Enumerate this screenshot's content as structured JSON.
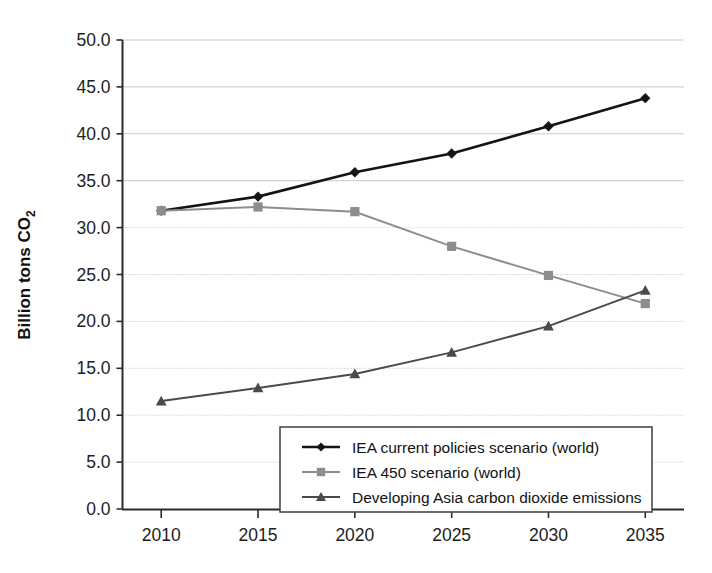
{
  "chart_data": {
    "type": "line",
    "title": "",
    "xlabel": "",
    "ylabel": "Billion tons CO2",
    "ylabel_main": "Billion tons CO",
    "ylabel_sub": "2",
    "x": [
      2010,
      2015,
      2020,
      2025,
      2030,
      2035
    ],
    "categories": [
      "2010",
      "2015",
      "2020",
      "2025",
      "2030",
      "2035"
    ],
    "xlim": [
      2008,
      2037
    ],
    "ylim": [
      0.0,
      50.0
    ],
    "ytick_labels": [
      "0.0",
      "5.0",
      "10.0",
      "15.0",
      "20.0",
      "25.0",
      "30.0",
      "35.0",
      "40.0",
      "45.0",
      "50.0"
    ],
    "ytick_values": [
      0,
      5,
      10,
      15,
      20,
      25,
      30,
      35,
      40,
      45,
      50
    ],
    "grid": true,
    "grid_style_note": "solid light gray above 35, dotted below 30",
    "legend_position": "lower center inside plot",
    "series": [
      {
        "name": "IEA current policies scenario (world)",
        "marker": "diamond",
        "color": "#141414",
        "values": [
          31.8,
          33.3,
          35.9,
          37.9,
          40.8,
          43.8
        ]
      },
      {
        "name": "IEA 450 scenario (world)",
        "marker": "square",
        "color": "#8d8d8d",
        "values": [
          31.8,
          32.2,
          31.7,
          28.0,
          24.9,
          21.9
        ]
      },
      {
        "name": "Developing Asia carbon dioxide emissions",
        "marker": "triangle",
        "color": "#4a4a4a",
        "values": [
          11.5,
          12.9,
          14.4,
          16.7,
          19.5,
          23.3
        ]
      }
    ]
  },
  "legend": {
    "items": [
      {
        "label": "IEA current policies scenario (world)",
        "marker": "diamond-marker-icon"
      },
      {
        "label": "IEA 450 scenario (world)",
        "marker": "square-marker-icon"
      },
      {
        "label": "Developing Asia carbon dioxide emissions",
        "marker": "triangle-marker-icon"
      }
    ]
  },
  "colors": {
    "series1": "#141414",
    "series2": "#8d8d8d",
    "series3": "#4a4a4a",
    "axis": "#2b2b2b",
    "grid_solid": "#c8c8c8",
    "grid_dotted": "#b8b8b8",
    "background": "#ffffff"
  }
}
